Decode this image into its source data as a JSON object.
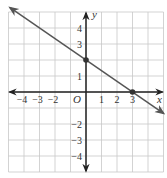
{
  "chart_data": {
    "type": "line",
    "title": "",
    "xlabel": "x",
    "ylabel": "y",
    "origin_label": "O",
    "xlim": [
      -5,
      5
    ],
    "ylim": [
      -5,
      5
    ],
    "grid": true,
    "x_tick_labels": [
      "−4",
      "−3",
      "−2",
      "1",
      "2",
      "3"
    ],
    "x_tick_values": [
      -4,
      -3,
      -2,
      1,
      2,
      3
    ],
    "y_tick_labels": [
      "4",
      "3",
      "1",
      "−2",
      "−3",
      "−4"
    ],
    "y_tick_values": [
      4,
      3,
      1,
      -2,
      -3,
      -4
    ],
    "series": [
      {
        "name": "line",
        "equation": "y = -2/3 x + 2",
        "slope": -0.6667,
        "intercept": 2,
        "x": [
          -4.9,
          5
        ],
        "y": [
          5.27,
          -1.33
        ],
        "arrows": "both"
      }
    ],
    "points": [
      {
        "label": "y-intercept",
        "x": 0,
        "y": 2
      },
      {
        "label": "x-intercept",
        "x": 3,
        "y": 0
      }
    ]
  },
  "colors": {
    "grid": "#c8c8c8",
    "axis": "#222222",
    "line": "#555555",
    "point": "#333333"
  }
}
